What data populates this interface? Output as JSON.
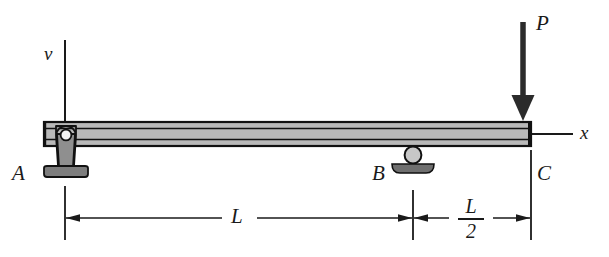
{
  "figure": {
    "type": "beam-free-body-diagram",
    "background_color": "#ffffff",
    "ink_color": "#1a1a1a",
    "beam_fill_color": "#b4b4b4",
    "support_fill_color": "#8c8c8c"
  },
  "axes": {
    "vertical": {
      "label": "v",
      "x": 65,
      "y_top": 40,
      "y_bottom": 122
    },
    "horizontal": {
      "label": "x",
      "y": 134,
      "x_left": 531,
      "x_right": 572
    }
  },
  "labels": {
    "point_a": "A",
    "point_b": "B",
    "point_c": "C",
    "load": "P",
    "span_full": "L",
    "span_half_numerator": "L",
    "span_half_denominator": "2"
  },
  "supports": [
    {
      "name": "pin-support",
      "point": "A",
      "x": 65,
      "type": "pin"
    },
    {
      "name": "roller-support",
      "point": "B",
      "x": 413,
      "type": "roller"
    }
  ],
  "load": {
    "name": "point-load",
    "symbol": "P",
    "direction": "down",
    "applied_at": "C",
    "x": 523,
    "arrow_top": 22,
    "arrow_tip": 121
  },
  "beam": {
    "x_left": 44,
    "x_right": 531,
    "y_top": 122,
    "y_bottom": 146
  },
  "dimensions": [
    {
      "name": "dimension-L",
      "label": "L",
      "from": "A",
      "to": "B",
      "x_start": 65,
      "x_end": 413,
      "y": 218
    },
    {
      "name": "dimension-L-over-2",
      "label": "L/2",
      "from": "B",
      "to": "C",
      "x_start": 413,
      "x_end": 531,
      "y": 218
    }
  ]
}
